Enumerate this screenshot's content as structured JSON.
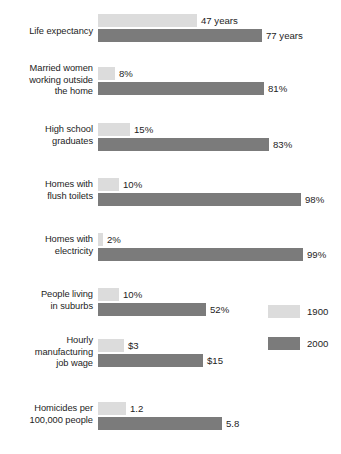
{
  "chart_data": {
    "type": "bar",
    "title": "",
    "subtitle": "",
    "xlabel": "",
    "ylabel": "",
    "orientation": "horizontal",
    "grouped": true,
    "grid": false,
    "legend_position": "right-middle",
    "legend": [
      {
        "name": "1900",
        "color": "#dcdcdc"
      },
      {
        "name": "2000",
        "color": "#7b7b7b"
      }
    ],
    "categories": [
      "Life expectancy",
      "Married women working outside the home",
      "High school graduates",
      "Homes with flush toilets",
      "Homes with electricity",
      "People living in suburbs",
      "Hourly manufacturing job wage",
      "Homicides per 100,000 people"
    ],
    "series": [
      {
        "name": "1900",
        "color": "#dcdcdc",
        "values": [
          47,
          8,
          15,
          10,
          2,
          10,
          3,
          1.2
        ],
        "labels": [
          "47 years",
          "8%",
          "15%",
          "10%",
          "2%",
          "10%",
          "$3",
          "1.2"
        ]
      },
      {
        "name": "2000",
        "color": "#7b7b7b",
        "values": [
          77,
          81,
          83,
          98,
          99,
          52,
          15,
          5.8
        ],
        "labels": [
          "77 years",
          "81%",
          "83%",
          "98%",
          "99%",
          "52%",
          "$15",
          "5.8"
        ]
      }
    ],
    "units": [
      "years",
      "percent",
      "percent",
      "percent",
      "percent",
      "percent",
      "dollars-per-hour",
      "rate-per-100000"
    ]
  },
  "groups": [
    {
      "id": "life-expectancy",
      "label_lines": [
        "Life expectancy"
      ],
      "top": 14,
      "label_top": 26,
      "bars": [
        {
          "series": "1900",
          "tone": "light",
          "width": 99,
          "label": "47 years"
        },
        {
          "series": "2000",
          "tone": "dark",
          "width": 164,
          "label": "77 years"
        }
      ]
    },
    {
      "id": "married-women-working-outside-home",
      "label_lines": [
        "Married women",
        "working outside",
        "the home"
      ],
      "top": 67,
      "label_top": 63,
      "bars": [
        {
          "series": "1900",
          "tone": "light",
          "width": 17,
          "label": "8%"
        },
        {
          "series": "2000",
          "tone": "dark",
          "width": 166,
          "label": "81%"
        }
      ]
    },
    {
      "id": "high-school-graduates",
      "label_lines": [
        "High school",
        "graduates"
      ],
      "top": 123,
      "label_top": 124,
      "bars": [
        {
          "series": "1900",
          "tone": "light",
          "width": 32,
          "label": "15%"
        },
        {
          "series": "2000",
          "tone": "dark",
          "width": 171,
          "label": "83%"
        }
      ]
    },
    {
      "id": "homes-with-flush-toilets",
      "label_lines": [
        "Homes with",
        "flush toilets"
      ],
      "top": 178,
      "label_top": 179,
      "bars": [
        {
          "series": "1900",
          "tone": "light",
          "width": 21,
          "label": "10%"
        },
        {
          "series": "2000",
          "tone": "dark",
          "width": 203,
          "label": "98%"
        }
      ]
    },
    {
      "id": "homes-with-electricity",
      "label_lines": [
        "Homes with",
        "electricity"
      ],
      "top": 233,
      "label_top": 234,
      "bars": [
        {
          "series": "1900",
          "tone": "light",
          "width": 5,
          "label": "2%"
        },
        {
          "series": "2000",
          "tone": "dark",
          "width": 205,
          "label": "99%"
        }
      ]
    },
    {
      "id": "people-living-in-suburbs",
      "label_lines": [
        "People living",
        "in suburbs"
      ],
      "top": 288,
      "label_top": 289,
      "bars": [
        {
          "series": "1900",
          "tone": "light",
          "width": 21,
          "label": "10%"
        },
        {
          "series": "2000",
          "tone": "dark",
          "width": 108,
          "label": "52%"
        }
      ]
    },
    {
      "id": "hourly-manufacturing-job-wage",
      "label_lines": [
        "Hourly",
        "manufacturing",
        "job wage"
      ],
      "top": 339,
      "label_top": 335,
      "bars": [
        {
          "series": "1900",
          "tone": "light",
          "width": 26,
          "label": "$3"
        },
        {
          "series": "2000",
          "tone": "dark",
          "width": 105,
          "label": "$15"
        }
      ]
    },
    {
      "id": "homicides-per-100000-people",
      "label_lines": [
        "Homicides per",
        "100,000 people"
      ],
      "top": 402,
      "label_top": 403,
      "bars": [
        {
          "series": "1900",
          "tone": "light",
          "width": 28,
          "label": "1.2"
        },
        {
          "series": "2000",
          "tone": "dark",
          "width": 124,
          "label": "5.8"
        }
      ]
    }
  ],
  "legend": {
    "items": [
      {
        "id": "1900",
        "tone": "light",
        "label": "1900",
        "top": 305
      },
      {
        "id": "2000",
        "tone": "dark",
        "label": "2000",
        "top": 337
      }
    ]
  }
}
